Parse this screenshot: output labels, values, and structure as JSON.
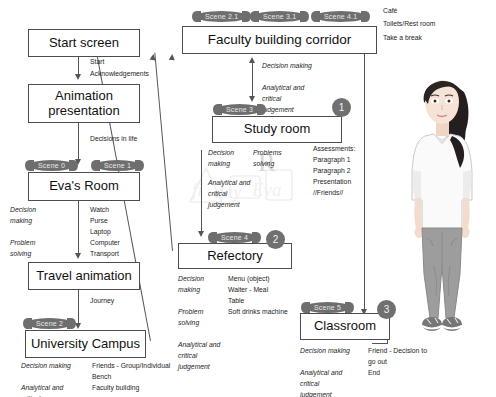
{
  "diagram": {
    "boxes": {
      "start_screen": "Start screen",
      "animation_presentation_l1": "Animation",
      "animation_presentation_l2": "presentation",
      "evas_room": "Eva's Room",
      "travel_animation": "Travel animation",
      "university_campus": "University Campus",
      "faculty_building_corridor": "Faculty building corridor",
      "study_room": "Study room",
      "refectory": "Refectory",
      "classroom": "Classroom"
    },
    "scene_pills": {
      "scene_0": "Scene 0",
      "scene_1": "Scene 1",
      "scene_2": "Scene 2",
      "scene_2_1": "Scene 2.1",
      "scene_3": "Scene 3",
      "scene_3_1": "Scene 3.1",
      "scene_4": "Scene 4",
      "scene_4_1": "Scene 4.1",
      "scene_5": "Scene 5"
    },
    "numbers": {
      "one": "1",
      "two": "2",
      "three": "3"
    },
    "edge_labels": {
      "start": "Start",
      "acknowledgements": "Acknowledgements",
      "decisions_in_life": "Decisions in life",
      "journey": "Journey"
    },
    "skills": {
      "evas_room": "Decision\nmaking\n\nProblem\nsolving",
      "campus": "Decision making\n\nAnalytical and\ncritical\njudgement",
      "corridor_study": "Decision making\n\nAnalytical and\ncritical\njudgement",
      "study_room_a": "Decision\nmaking",
      "study_room_b": "Problems\nsolving",
      "study_room_c": "Analytical and\ncritical\njudgement",
      "refectory": "Decision\nmaking\n\nProblem\nsolving\n\nAnalytical and\ncritical\njudgement",
      "classroom": "Decision making\n\nAnalytical and\ncritical\njudgement"
    },
    "objects": {
      "evas_room": "Watch\nPurse\nLaptop\nComputer\nTransport",
      "campus": "Friends - Group/Individual\nBench\nFaculty building",
      "study_room": "Assessments:\nParagraph 1\nParagraph 2\nPresentation\n//Friends//",
      "refectory": "Menu (object)\nWaiter - Meal\nTable\nSoft drinks machine",
      "classroom": "Friend - Decision to\ngo out\nEnd"
    },
    "right_labels": [
      "Café",
      "Toilets/Rest room",
      "Take a break"
    ],
    "colors": {
      "pill_fill": "#6e6e6e",
      "circle_fill": "#707070",
      "line": "#555555",
      "box_border": "#4d4d4d",
      "skin": "#f3ddcf",
      "hair": "#241f1e",
      "shirt": "#fafafa",
      "trousers": "#9a9a9a",
      "shoes": "#6d6d6d"
    }
  }
}
